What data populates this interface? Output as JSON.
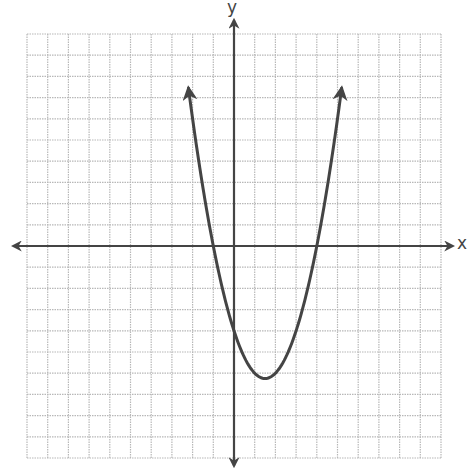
{
  "chart_data": {
    "type": "line",
    "title": "",
    "xlabel": "x",
    "ylabel": "y",
    "xlim": [
      -10,
      10
    ],
    "ylim": [
      -10,
      10
    ],
    "grid": true,
    "grid_step": 1,
    "tick_labels": false,
    "series": [
      {
        "name": "parabola",
        "equation": "y = x^2 - 3x - 4",
        "x_range": [
          -2.2,
          5.2
        ],
        "roots": [
          -1,
          4
        ],
        "vertex": [
          1.5,
          -6.25
        ],
        "y_intercept": -4,
        "both_ends_arrows": true,
        "color": "#444444"
      }
    ]
  },
  "labels": {
    "x_axis": "x",
    "y_axis": "y"
  },
  "colors": {
    "grid": "#b8b8b8",
    "axis": "#444444",
    "curve": "#444444"
  }
}
